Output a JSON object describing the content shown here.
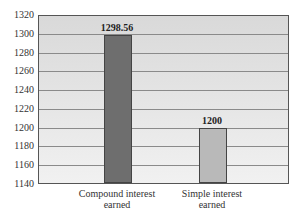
{
  "chart_data": {
    "type": "bar",
    "title": "",
    "xlabel": "",
    "ylabel": "",
    "categories": [
      "Compound interest earned",
      "Simple interest earned"
    ],
    "category_lines": [
      [
        "Compound interest",
        "earned"
      ],
      [
        "Simple interest",
        "earned"
      ]
    ],
    "values": [
      1298.56,
      1200
    ],
    "value_labels": [
      "1298.56",
      "1200"
    ],
    "bar_colors": [
      "#6e6e6e",
      "#b9b9b9"
    ],
    "ylim": [
      1140,
      1320
    ],
    "yticks": [
      1140,
      1160,
      1180,
      1200,
      1220,
      1240,
      1260,
      1280,
      1300,
      1320
    ],
    "ytick_labels": [
      "1140",
      "1160",
      "1180",
      "1200",
      "1220",
      "1240",
      "1260",
      "1280",
      "1300",
      "1320"
    ],
    "grid": true,
    "legend": null
  }
}
